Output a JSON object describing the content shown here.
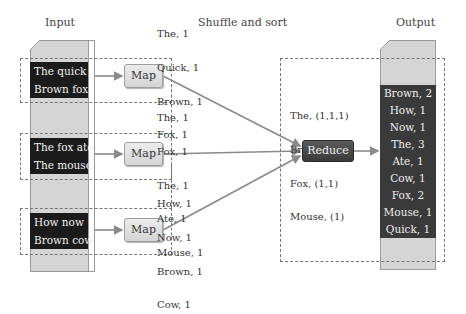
{
  "headings": {
    "input": "Input",
    "shuffle": "Shuffle and sort",
    "output": "Output"
  },
  "input_splits": [
    {
      "lines": [
        "The quick",
        "Brown fox"
      ]
    },
    {
      "lines": [
        "The fox ate",
        "The mouse"
      ]
    },
    {
      "lines": [
        "How now",
        "Brown cow"
      ]
    }
  ],
  "map_label": "Map",
  "map_outputs": [
    {
      "pairs": [
        "The, 1",
        "Quick, 1",
        "Brown, 1",
        "Fox, 1"
      ]
    },
    {
      "pairs": [
        "The, 1",
        "Fox, 1",
        "The, 1",
        "Ate, 1",
        "Mouse, 1"
      ]
    },
    {
      "pairs": [
        "How, 1",
        "Now, 1",
        "Brown, 1",
        "Cow, 1"
      ]
    }
  ],
  "grouped": [
    "The, (1,1,1)",
    "Brown, (1,1)",
    "Fox, (1,1)",
    "Mouse, (1)"
  ],
  "reduce_label": "Reduce",
  "output": [
    "Brown, 2",
    "How, 1",
    "Now, 1",
    "The, 3",
    "Ate, 1",
    "Cow, 1",
    "Fox, 2",
    "Mouse, 1",
    "Quick, 1"
  ],
  "colors": {
    "page": "#d5d5d5",
    "dark_block": "#1b1b1b",
    "output_block": "#3a3a3a",
    "arrow": "#8a8a8a",
    "dash": "#777777"
  }
}
